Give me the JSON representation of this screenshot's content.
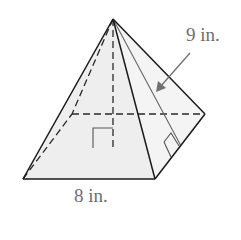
{
  "figure": {
    "type": "square pyramid",
    "labels": {
      "slant_height": "9 in.",
      "base_edge": "8 in."
    },
    "colors": {
      "face_fill": "#efefef",
      "right_face_fill": "#f5f5f5",
      "edge": "#1a1a1a",
      "hidden_edge": "#2a2a2a",
      "label": "#6e6e6e",
      "slant_line": "#666666",
      "arrow": "#707070"
    },
    "annotations": [
      "right-angle marker at foot of height",
      "right-angle marker at foot of slant height",
      "arrow pointing to slant height"
    ]
  }
}
